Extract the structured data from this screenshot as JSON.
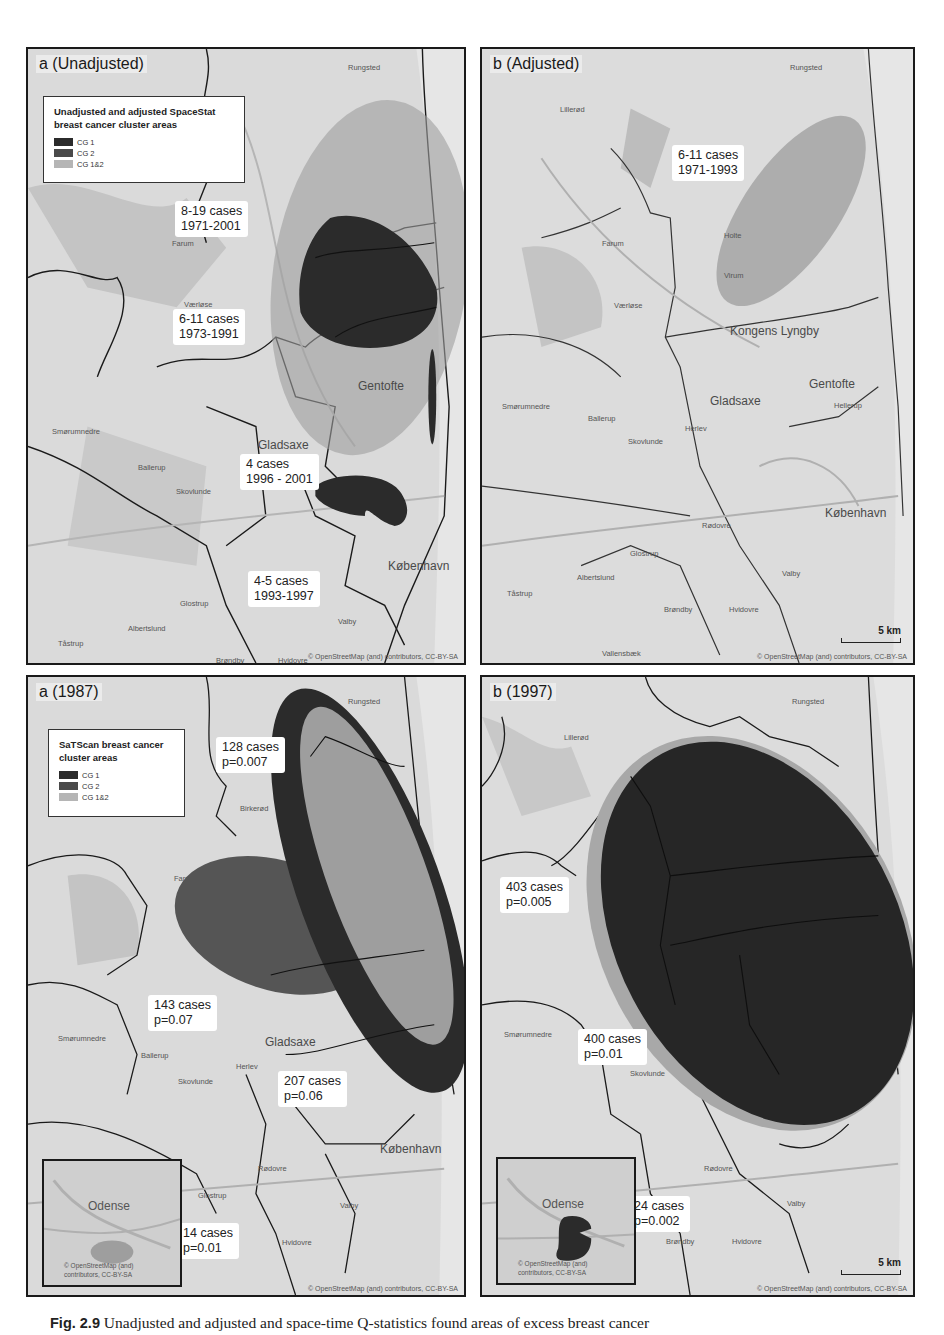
{
  "figure": {
    "caption_label": "Fig. 2.9",
    "caption_text": "Unadjusted and adjusted and space-time Q-statistics found areas of excess breast cancer",
    "colors": {
      "cg1": "#2b2b2b",
      "cg2": "#4a4a4a",
      "cg12": "#9e9e9e",
      "map_base": "#d9d9d9"
    }
  },
  "panels": {
    "top_left": {
      "label": "a (Unadjusted)",
      "legend": {
        "title_line1": "Unadjusted and adjusted SpaceStat",
        "title_line2": "breast cancer cluster areas",
        "items": [
          {
            "label": "CG 1"
          },
          {
            "label": "CG 2"
          },
          {
            "label": "CG 1&2"
          }
        ]
      },
      "callouts": [
        {
          "line1": "8-19 cases",
          "line2": "1971-2001"
        },
        {
          "line1": "6-11 cases",
          "line2": "1973-1991"
        },
        {
          "line1": "4 cases",
          "line2": "1996 - 2001"
        },
        {
          "line1": "4-5 cases",
          "line2": "1993-1997"
        }
      ],
      "places": [
        "Rungsted",
        "Farum",
        "Værløse",
        "Gladsaxe",
        "Gentofte",
        "Smørumnedre",
        "Ballerup",
        "Skovlunde",
        "Glostrup",
        "Albertslund",
        "Tåstrup",
        "Brøndby",
        "Hvidovre",
        "Valby",
        "København",
        "Vallensbæk"
      ],
      "attribution": "© OpenStreetMap (and) contributors, CC-BY-SA"
    },
    "top_right": {
      "label": "b (Adjusted)",
      "callouts": [
        {
          "line1": "6-11 cases",
          "line2": "1971-1993"
        }
      ],
      "places": [
        "Rungsted",
        "Lillerød",
        "Farum",
        "Holte",
        "Virum",
        "Værløse",
        "Kongens Lyngby",
        "Gladsaxe",
        "Gentofte",
        "Hellerup",
        "Smørumnedre",
        "Ballerup",
        "Herlev",
        "Skovlunde",
        "Rødovre",
        "København",
        "Glostrup",
        "Albertslund",
        "Tåstrup",
        "Valby",
        "Brøndby",
        "Hvidovre",
        "Vallensbæk"
      ],
      "scale": "5 km",
      "attribution": "© OpenStreetMap (and) contributors, CC-BY-SA"
    },
    "bottom_left": {
      "label": "a (1987)",
      "legend": {
        "title_line1": "SaTScan breast cancer",
        "title_line2": "cluster areas",
        "items": [
          {
            "label": "CG 1"
          },
          {
            "label": "CG 2"
          },
          {
            "label": "CG 1&2"
          }
        ]
      },
      "callouts": [
        {
          "line1": "128 cases",
          "line2": "p=0.007"
        },
        {
          "line1": "143 cases",
          "line2": "p=0.07"
        },
        {
          "line1": "207 cases",
          "line2": "p=0.06"
        },
        {
          "line1": "14 cases",
          "line2": "p=0.01"
        }
      ],
      "places": [
        "Rungsted",
        "Birkerød",
        "Farum",
        "Gladsaxe",
        "Smørumnedre",
        "Ballerup",
        "Herlev",
        "Skovlunde",
        "Rødovre",
        "København",
        "Glostrup",
        "Valby",
        "Hvidovre"
      ],
      "inset": {
        "city": "Odense",
        "attribution_line1": "© OpenStreetMap (and)",
        "attribution_line2": "contributors, CC-BY-SA"
      },
      "attribution": "© OpenStreetMap (and) contributors, CC-BY-SA"
    },
    "bottom_right": {
      "label": "b (1997)",
      "callouts": [
        {
          "line1": "403 cases",
          "line2": "p=0.005"
        },
        {
          "line1": "400 cases",
          "line2": "p=0.01"
        },
        {
          "line1": "24 cases",
          "line2": "p=0.002"
        }
      ],
      "places": [
        "Rungsted",
        "Lillerød",
        "Smørumnedre",
        "Skovlunde",
        "Rødovre",
        "Valby",
        "Brøndby",
        "Hvidovre"
      ],
      "inset": {
        "city": "Odense",
        "attribution_line1": "© OpenStreetMap (and)",
        "attribution_line2": "contributors, CC-BY-SA"
      },
      "scale": "5 km",
      "attribution": "© OpenStreetMap (and) contributors, CC-BY-SA"
    }
  }
}
